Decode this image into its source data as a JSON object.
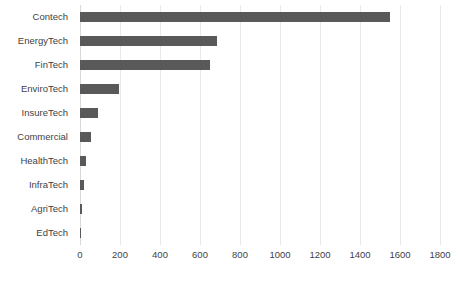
{
  "chart_data": {
    "type": "bar",
    "orientation": "horizontal",
    "title": "",
    "subtitle": "",
    "xlabel": "",
    "ylabel": "",
    "categories": [
      "Contech",
      "EnergyTech",
      "FinTech",
      "EnviroTech",
      "InsureTech",
      "Commercial",
      "HealthTech",
      "InfraTech",
      "AgriTech",
      "EdTech"
    ],
    "values": [
      1550,
      685,
      650,
      195,
      90,
      55,
      28,
      18,
      10,
      4
    ],
    "xlim": [
      0,
      1800
    ],
    "xticks": [
      0,
      200,
      400,
      600,
      800,
      1000,
      1200,
      1400,
      1600,
      1800
    ],
    "xtick_labels": [
      "0",
      "200",
      "400",
      "600",
      "800",
      "1000",
      "1200",
      "1400",
      "1600",
      "1800"
    ],
    "grid": "vertical",
    "legend": null,
    "annotations": [],
    "colors": {
      "bar": "#595959",
      "gridline": "#e8e8e8",
      "axis": "#d9d9d9",
      "text": "#3f3f3f",
      "background": "#ffffff"
    }
  }
}
